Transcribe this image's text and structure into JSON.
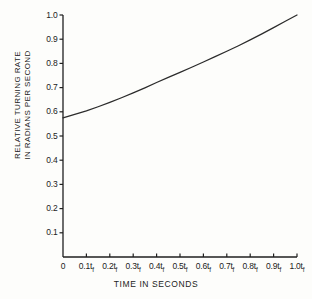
{
  "chart_data": {
    "type": "line",
    "title": "",
    "xlabel": "TIME IN SECONDS",
    "ylabel_line1": "RELATIVE TURNING RATE",
    "ylabel_line2": "IN RADIANS PER SECOND",
    "xlim": [
      0,
      1.0
    ],
    "ylim": [
      0,
      1.0
    ],
    "grid": false,
    "legend": "none",
    "x_tick_labels": [
      "0",
      "0.1t",
      "0.2t",
      "0.3t",
      "0.4t",
      "0.5t",
      "0.6t",
      "0.7t",
      "0.8t",
      "0.9t",
      "1.0t"
    ],
    "x_tick_subscript": "f",
    "x_tick_values": [
      0,
      0.1,
      0.2,
      0.3,
      0.4,
      0.5,
      0.6,
      0.7,
      0.8,
      0.9,
      1.0
    ],
    "y_tick_labels": [
      "0.1",
      "0.2",
      "0.3",
      "0.4",
      "0.5",
      "0.6",
      "0.7",
      "0.8",
      "0.9",
      "1.0"
    ],
    "y_tick_values": [
      0.1,
      0.2,
      0.3,
      0.4,
      0.5,
      0.6,
      0.7,
      0.8,
      0.9,
      1.0
    ],
    "series": [
      {
        "name": "relative turning rate",
        "color": "#2b2b2b",
        "x": [
          0.0,
          0.05,
          0.1,
          0.15,
          0.2,
          0.25,
          0.3,
          0.35,
          0.4,
          0.45,
          0.5,
          0.55,
          0.6,
          0.65,
          0.7,
          0.75,
          0.8,
          0.85,
          0.9,
          0.95,
          1.0
        ],
        "values": [
          0.575,
          0.589,
          0.604,
          0.621,
          0.639,
          0.658,
          0.678,
          0.699,
          0.721,
          0.742,
          0.763,
          0.784,
          0.806,
          0.828,
          0.85,
          0.873,
          0.897,
          0.922,
          0.948,
          0.974,
          1.0
        ]
      }
    ]
  },
  "axes": {
    "axis_color": "#1f1f1f",
    "line_color": "#2b2b2b"
  },
  "geometry": {
    "plot_left": 63,
    "plot_right": 297,
    "plot_top": 15,
    "plot_bottom": 257
  }
}
